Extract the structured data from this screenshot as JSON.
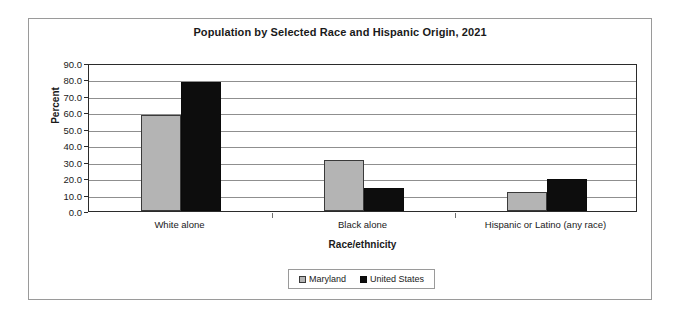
{
  "chart_data": {
    "type": "bar",
    "title": "Population by Selected Race and Hispanic Origin, 2021",
    "xlabel": "Race/ethnicity",
    "ylabel": "Percent",
    "categories": [
      "White alone",
      "Black alone",
      "Hispanic or Latino (any race)"
    ],
    "series": [
      {
        "name": "Maryland",
        "color": "#b4b4b4",
        "values": [
          58.5,
          31.1,
          11.5
        ]
      },
      {
        "name": "United States",
        "color": "#0d0d0d",
        "values": [
          78.6,
          14.2,
          19.4
        ]
      }
    ],
    "ylim": [
      0.0,
      90.0
    ],
    "ytick_step": 10.0,
    "ytick_labels": [
      "90.0",
      "80.0",
      "70.0",
      "60.0",
      "50.0",
      "40.0",
      "30.0",
      "20.0",
      "10.0",
      "0.0"
    ],
    "grid": true,
    "legend_position": "bottom-center"
  },
  "legend": {
    "entries": [
      {
        "label": "Maryland"
      },
      {
        "label": "United States"
      }
    ]
  }
}
